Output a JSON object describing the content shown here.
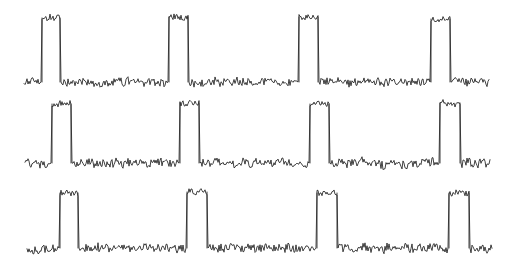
{
  "figure": {
    "title": "",
    "background_color": "#ffffff",
    "width": 508,
    "height": 278,
    "trace_color": "#2b2b2b",
    "line_width": 0.9,
    "panel_count": 3
  },
  "chart_data": {
    "type": "line",
    "title": "",
    "subtitle": "",
    "xlabel": "",
    "ylabel": "",
    "xlim": [
      0,
      508
    ],
    "ylim": [
      0,
      278
    ],
    "grid": false,
    "legend": "none",
    "axes_visible": false,
    "tick_labels_x": [],
    "tick_labels_y": [],
    "annotations": [],
    "series": [
      {
        "name": "trace-1",
        "row": 1,
        "x_start": 24,
        "x_end": 489,
        "baseline_y": 82,
        "peak_top_y": 18,
        "pulse_height": 64,
        "noise_amplitude": 5.0,
        "noise_step": 2.2,
        "pulse_noise_amplitude": 6.5,
        "seed": 1337,
        "pulses": [
          {
            "index": 1,
            "rise_x": 42,
            "fall_x": 60,
            "top_y": 18
          },
          {
            "index": 2,
            "rise_x": 169,
            "fall_x": 188,
            "top_y": 17
          },
          {
            "index": 3,
            "rise_x": 299,
            "fall_x": 318,
            "top_y": 17
          },
          {
            "index": 4,
            "rise_x": 431,
            "fall_x": 450,
            "top_y": 19
          }
        ]
      },
      {
        "name": "trace-2",
        "row": 2,
        "x_start": 25,
        "x_end": 490,
        "baseline_y": 163,
        "peak_top_y": 103,
        "pulse_height": 60,
        "noise_amplitude": 5.2,
        "noise_step": 2.3,
        "pulse_noise_amplitude": 6.0,
        "seed": 24601,
        "pulses": [
          {
            "index": 1,
            "rise_x": 52,
            "fall_x": 71,
            "top_y": 104
          },
          {
            "index": 2,
            "rise_x": 180,
            "fall_x": 199,
            "top_y": 103
          },
          {
            "index": 3,
            "rise_x": 310,
            "fall_x": 329,
            "top_y": 104
          },
          {
            "index": 4,
            "rise_x": 440,
            "fall_x": 460,
            "top_y": 103
          }
        ]
      },
      {
        "name": "trace-3",
        "row": 3,
        "x_start": 27,
        "x_end": 492,
        "baseline_y": 248,
        "peak_top_y": 192,
        "pulse_height": 56,
        "noise_amplitude": 5.0,
        "noise_step": 2.2,
        "pulse_noise_amplitude": 6.2,
        "seed": 90210,
        "pulses": [
          {
            "index": 1,
            "rise_x": 60,
            "fall_x": 78,
            "top_y": 193
          },
          {
            "index": 2,
            "rise_x": 187,
            "fall_x": 207,
            "top_y": 192
          },
          {
            "index": 3,
            "rise_x": 317,
            "fall_x": 337,
            "top_y": 193
          },
          {
            "index": 4,
            "rise_x": 449,
            "fall_x": 469,
            "top_y": 193
          }
        ]
      }
    ]
  }
}
